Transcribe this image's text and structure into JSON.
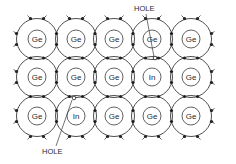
{
  "diagram": {
    "grid": {
      "columns": 5,
      "rows": 3,
      "col_x": [
        37,
        76,
        114,
        152,
        191
      ],
      "row_y": [
        39,
        77,
        116
      ],
      "outer_radius": 20.5,
      "inner_radius": 9
    },
    "atoms": [
      [
        "Ge",
        "Ge",
        "Ge",
        "Ge",
        "Ge"
      ],
      [
        "Ge",
        "Ge",
        "Ge",
        "In",
        "Ge"
      ],
      [
        "Ge",
        "In",
        "Ge",
        "Ge",
        "Ge"
      ]
    ],
    "annotations": [
      {
        "label": "HOLE",
        "label_x": 134,
        "label_y": 11,
        "line_from": [
          146,
          14
        ],
        "line_to": [
          154,
          57
        ],
        "hole": [
          155,
          58
        ]
      },
      {
        "label": "HOLE",
        "label_x": 42,
        "label_y": 154,
        "line_from": [
          56,
          146
        ],
        "line_to": [
          72,
          100
        ],
        "hole": [
          74,
          98
        ]
      }
    ],
    "colors": {
      "line": "#3a3a3a",
      "electron": "#1e1e1e",
      "background": "#ffffff"
    }
  }
}
